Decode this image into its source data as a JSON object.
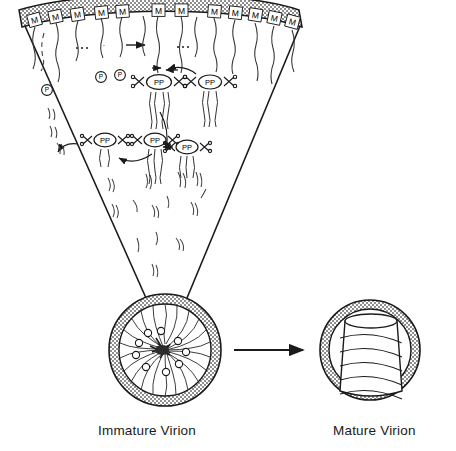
{
  "figure": {
    "title_immature": "Immature Virion",
    "title_mature": "Mature Virion",
    "membrane": {
      "protein_label": "M",
      "protein_count": 13,
      "ellipsis": "...",
      "ellipsis_count": 2,
      "fill_color": "#b4b4b4",
      "stroke_color": "#1a1a1a"
    },
    "precursors": {
      "single_label": "P",
      "single_count": 3,
      "dimer_label": "PP",
      "dimer_count": 5,
      "cleavage_icon": "scissor-x-icon",
      "cleavage_count": 16
    },
    "arrows": {
      "maturation": "maturation-arrow",
      "small_right": "small-right-arrow",
      "curved": "curved-process-arrow",
      "curved_count": 3,
      "inward_pair": "inward-arrow-pair"
    },
    "fragments": {
      "name": "cleaved-peptide-fragment",
      "count": 22
    },
    "immature_virion": {
      "spoke_count": 24,
      "knob_count": 9,
      "envelope_color": "#b4b4b4"
    },
    "mature_virion": {
      "core_shape": "conical-capsid",
      "helix_bands": 6,
      "envelope_color": "#b4b4b4"
    },
    "colors": {
      "ink": "#1a1a1a",
      "membrane": "#b4b4b4",
      "paper": "#ffffff"
    }
  }
}
